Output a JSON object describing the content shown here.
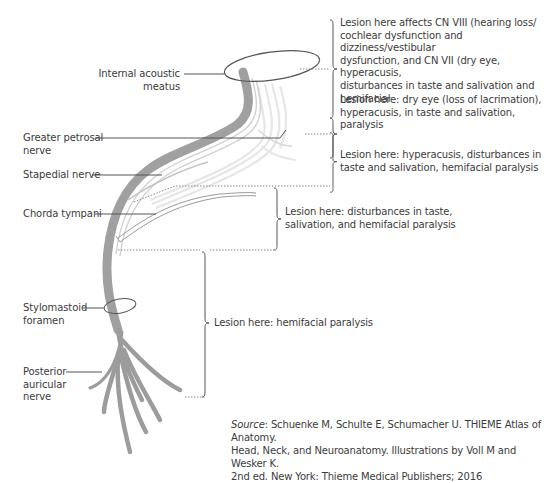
{
  "diagram": {
    "structure_labels": {
      "internal_acoustic_meatus": [
        "Internal acoustic",
        "meatus"
      ],
      "greater_petrosal_nerve": [
        "Greater petrosal",
        "nerve"
      ],
      "stapedial_nerve": [
        "Stapedial nerve"
      ],
      "chorda_tympani": [
        "Chorda tympani"
      ],
      "stylomastoid_foramen": [
        "Stylomastoid",
        "foramen"
      ],
      "posterior_auricular_nerve": [
        "Posterior",
        "auricular",
        "nerve"
      ]
    },
    "lesions": [
      {
        "level": "internal-acoustic-meatus",
        "lines": [
          "Lesion here affects CN VIII (hearing loss/",
          "cochlear dysfunction and dizziness/vestibular",
          "dysfunction, and CN VII (dry eye, hyperacusis,",
          "disturbances in taste and salivation and",
          "hemifacial"
        ]
      },
      {
        "level": "geniculate-ganglion",
        "lines": [
          "Lesion here: dry eye (loss of lacrimation),",
          "hyperacusis, in taste and salivation, paralysis"
        ]
      },
      {
        "level": "above-stapedial-nerve",
        "lines": [
          "Lesion here: hyperacusis, disturbances in",
          "taste and salivation, hemifacial paralysis"
        ]
      },
      {
        "level": "above-chorda-tympani",
        "lines": [
          "Lesion here: disturbances in taste,",
          "salivation, and hemifacial paralysis"
        ]
      },
      {
        "level": "stylomastoid-foramen",
        "lines": [
          "Lesion here: hemifacial paralysis"
        ]
      }
    ],
    "source": {
      "prefix": "Source",
      "line1": ": Schuenke M, Schulte E, Schumacher U. THIEME Atlas of Anatomy.",
      "line2": "Head, Neck, and Neuroanatomy. Illustrations by Voll M and Wesker K.",
      "line3": "2nd ed. New York: Thieme Medical Publishers; 2016"
    },
    "colors": {
      "nerve_main": "#9a9a9a",
      "nerve_light": "#d6d6d6",
      "nerve_faint": "#e8e8e8",
      "leader_line": "#555555",
      "dotted_line": "#8a8a8a",
      "text": "#3c3c3c"
    }
  }
}
